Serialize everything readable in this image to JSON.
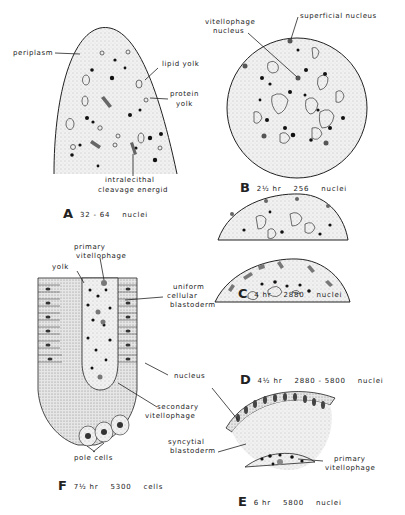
{
  "panels": {
    "A": {
      "letter": "A",
      "count": "32 - 64",
      "unit": "nuclei",
      "labels": {
        "periplasm": "periplasm",
        "lipid_yolk": "lipid  yolk",
        "protein": "protein",
        "yolk": "yolk",
        "intralecithal": "intralecithal",
        "cleavage_energid": "cleavage  energid"
      }
    },
    "B": {
      "letter": "B",
      "time": "2½  hr",
      "count": "256",
      "unit": "nuclei",
      "labels": {
        "vitellophage": "vitellophage",
        "nucleus": "nucleus",
        "superficial_nucleus": "superficial  nucleus"
      }
    },
    "C": {
      "letter": "C",
      "time": "4 hr",
      "count": "2880",
      "unit": "nuclei"
    },
    "D": {
      "letter": "D",
      "time": "4½  hr",
      "count": "2880 - 5800",
      "unit": "nuclei"
    },
    "E": {
      "letter": "E",
      "time": "6 hr",
      "count": "5800",
      "unit": "nuclei",
      "labels": {
        "syncytial": "syncytial",
        "blastoderm": "blastoderm",
        "primary": "primary",
        "vitellophage": "vitellophage"
      }
    },
    "F": {
      "letter": "F",
      "time": "7½  hr",
      "count": "5300",
      "unit": "cells",
      "labels": {
        "primary": "primary",
        "vitellophage": "vitellophage",
        "yolk": "yolk",
        "uniform": "uniform",
        "cellular": "cellular",
        "blastoderm": "blastoderm",
        "nucleus": "nucleus",
        "secondary": "secondary",
        "secondary_vitellophage": "vitellophage",
        "pole_cells": "pole  cells"
      }
    }
  }
}
